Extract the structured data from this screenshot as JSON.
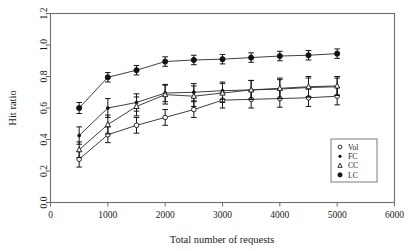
{
  "chart_data": {
    "type": "line",
    "title": "",
    "xlabel": "Total number of requests",
    "ylabel": "Hit ratio",
    "xlim": [
      0,
      6000
    ],
    "ylim": [
      0.0,
      1.2
    ],
    "xticks": [
      0,
      1000,
      2000,
      3000,
      4000,
      5000,
      6000
    ],
    "xticklabels": [
      "0",
      "1000",
      "2000",
      "3000",
      "4000",
      "5000",
      "6000"
    ],
    "yticks": [
      0.0,
      0.2,
      0.4,
      0.6,
      0.8,
      1.0,
      1.2
    ],
    "yticklabels": [
      "0.0",
      "0.2",
      "0.4",
      "0.6",
      "0.8",
      "1.0",
      "1.2"
    ],
    "grid": false,
    "errorbars": true,
    "legend_position": "lower-right",
    "x": [
      500,
      1000,
      1500,
      2000,
      2500,
      3000,
      3500,
      4000,
      4500,
      5000
    ],
    "series": [
      {
        "name": "Vol",
        "marker": "open-circle",
        "values": [
          0.275,
          0.43,
          0.49,
          0.54,
          0.59,
          0.65,
          0.655,
          0.66,
          0.665,
          0.675
        ],
        "errors": [
          0.05,
          0.05,
          0.05,
          0.05,
          0.05,
          0.05,
          0.055,
          0.055,
          0.055,
          0.055
        ]
      },
      {
        "name": "FC",
        "marker": "small-dot",
        "values": [
          0.425,
          0.6,
          0.635,
          0.695,
          0.7,
          0.71,
          0.715,
          0.72,
          0.73,
          0.735
        ],
        "errors": [
          0.055,
          0.06,
          0.055,
          0.055,
          0.055,
          0.055,
          0.06,
          0.06,
          0.06,
          0.055
        ]
      },
      {
        "name": "CC",
        "marker": "open-triangle",
        "values": [
          0.335,
          0.495,
          0.61,
          0.685,
          0.675,
          0.695,
          0.715,
          0.725,
          0.735,
          0.74
        ],
        "errors": [
          0.05,
          0.06,
          0.06,
          0.06,
          0.065,
          0.06,
          0.06,
          0.065,
          0.065,
          0.06
        ]
      },
      {
        "name": "LC",
        "marker": "filled-circle",
        "values": [
          0.6,
          0.795,
          0.84,
          0.895,
          0.905,
          0.91,
          0.92,
          0.93,
          0.935,
          0.945
        ],
        "errors": [
          0.035,
          0.03,
          0.03,
          0.03,
          0.03,
          0.03,
          0.03,
          0.03,
          0.03,
          0.03
        ]
      }
    ],
    "legend": [
      {
        "label": "Vol",
        "marker": "open-circle"
      },
      {
        "label": "FC",
        "marker": "small-dot"
      },
      {
        "label": "CC",
        "marker": "open-triangle"
      },
      {
        "label": "LC",
        "marker": "filled-circle"
      }
    ],
    "colors": {
      "line": "#2a2a2a",
      "marker": "#121212",
      "frame": "#6e6e6e",
      "background": "#ffffff"
    }
  }
}
